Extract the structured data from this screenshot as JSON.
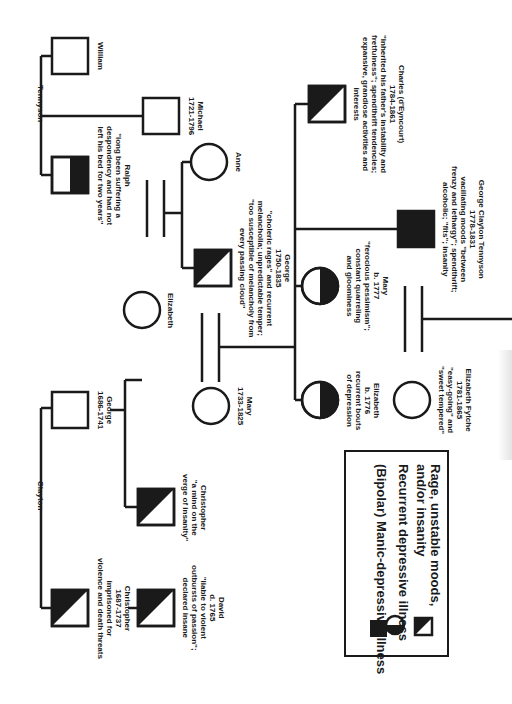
{
  "colors": {
    "ink": "#1a1a1a",
    "background": "#ffffff"
  },
  "families": {
    "tennyson": "Tennyson",
    "clayton": "Clayton"
  },
  "people": {
    "william": {
      "lines": [
        "William"
      ],
      "symbol": "square",
      "affection": "none"
    },
    "michael": {
      "lines": [
        "Michael",
        "1721-1796"
      ],
      "symbol": "square",
      "affection": "none"
    },
    "ralph": {
      "lines": [
        "Ralph",
        "\"long been suffering a",
        "despondency and had not",
        "left his bed for two years\""
      ],
      "symbol": "square",
      "affection": "recurrent-depressive"
    },
    "anne": {
      "lines": [
        "Anne"
      ],
      "symbol": "circle",
      "affection": "none"
    },
    "george1750": {
      "lines": [
        "George",
        "1750-1835",
        "\"choleric rages\" and recurrent",
        "melancholia; unpredictable temper;",
        "\"too susceptible of melancholy from",
        "every passing cloud\""
      ],
      "symbol": "square",
      "affection": "rage"
    },
    "elizabeth_clayton": {
      "lines": [
        "Elizabeth"
      ],
      "symbol": "circle",
      "affection": "none"
    },
    "charles": {
      "lines": [
        "Charles (d'Eyncourt)",
        "1784-1861",
        "\"inherited his father's instability and",
        "fretfulness\"; spendthrift tendencies;",
        "expansive, grandiose activities and",
        "interests"
      ],
      "symbol": "square",
      "affection": "rage"
    },
    "george_clayton": {
      "lines": [
        "George Clayton Tennyson",
        "1778-1831",
        "vacillating moods \"between",
        "frenzy and lethargy\"; spendthrift;",
        "alcoholic; \"fits\"; insanity"
      ],
      "symbol": "square",
      "affection": "bipolar"
    },
    "mary1777": {
      "lines": [
        "Mary",
        "b. 1777",
        "\"ferocious pessimism\";",
        "constant quarreling",
        "and gloominess"
      ],
      "symbol": "circle",
      "affection": "recurrent-depressive"
    },
    "elizabeth1776": {
      "lines": [
        "Elizabeth",
        "b. 1776",
        "recurrent bouts",
        "of depression"
      ],
      "symbol": "circle",
      "affection": "recurrent-depressive"
    },
    "elizabeth_fytche": {
      "lines": [
        "Elizabeth Fytche",
        "1781-1865",
        "\"easy-going\" and",
        "\"sweet tempered\""
      ],
      "symbol": "circle",
      "affection": "none"
    },
    "george1686": {
      "lines": [
        "George",
        "1686-1741"
      ],
      "symbol": "square",
      "affection": "none"
    },
    "mary1733": {
      "lines": [
        "Mary",
        "1733-1825"
      ],
      "symbol": "circle",
      "affection": "none"
    },
    "christopher_b": {
      "lines": [
        "Christopher",
        "\"a mind on the",
        "verge of insanity\""
      ],
      "symbol": "square",
      "affection": "rage"
    },
    "christopher_a": {
      "lines": [
        "Christopher",
        "1687-1737",
        "imprisoned for",
        "violence and death threats"
      ],
      "symbol": "square",
      "affection": "rage"
    },
    "david": {
      "lines": [
        "David",
        "d. 1765",
        "\"liable to violent",
        "outbursts of passion\";",
        "declared insane"
      ],
      "symbol": "square",
      "affection": "rage"
    }
  },
  "legend": {
    "items": [
      {
        "symbol": "bipolar",
        "lines": [
          "(Bipolar) Manic-depressive illness"
        ]
      },
      {
        "symbol": "recurrent-depressive",
        "lines": [
          "Recurrent depressive illness"
        ]
      },
      {
        "symbol": "rage",
        "lines": [
          "Rage, unstable moods,",
          "and/or insanity"
        ]
      }
    ]
  }
}
